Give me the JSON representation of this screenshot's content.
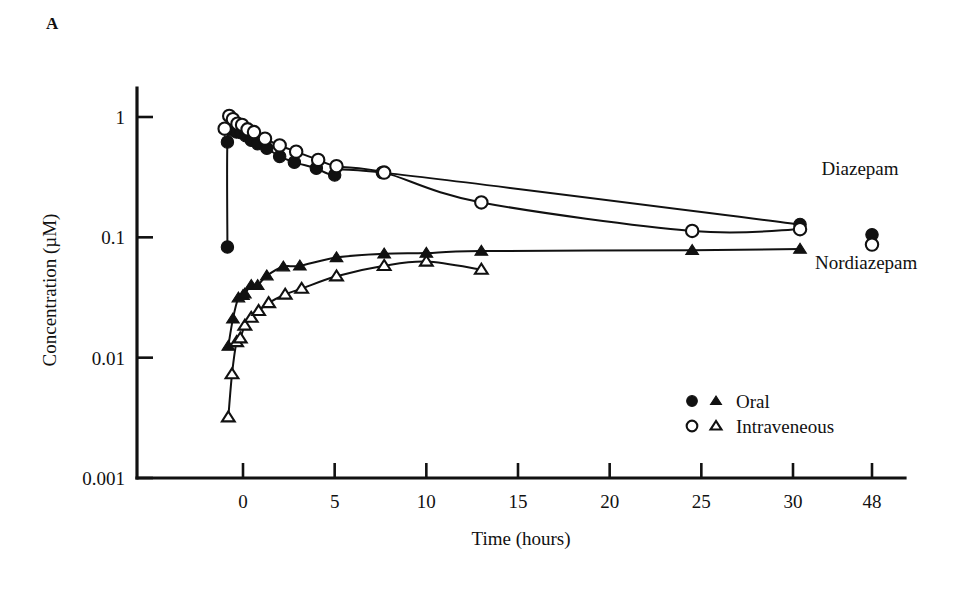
{
  "panel": {
    "label": "A"
  },
  "chart_data": {
    "type": "line",
    "title": "",
    "subtitle": "",
    "xlabel": "Time (hours)",
    "ylabel": "Concentration (µM)",
    "yscale": "log",
    "ylim": [
      0.001,
      2.0
    ],
    "yticks": [
      1,
      0.1,
      0.01,
      0.001
    ],
    "yticklabels": [
      "1",
      "0.1",
      "0.01",
      "0.001"
    ],
    "xticks": [
      0,
      5,
      10,
      15,
      20,
      25,
      30,
      48
    ],
    "xticklabels": [
      "0",
      "5",
      "10",
      "15",
      "20",
      "25",
      "30",
      "48"
    ],
    "xlim": [
      -1.8,
      50
    ],
    "x_axis_break_after": 30,
    "grid": false,
    "legend_position": "lower-right",
    "annotations": [
      {
        "text": "Diazepam",
        "x": 36.5,
        "y": 0.33
      },
      {
        "text": "Nordiazepam",
        "x": 35.0,
        "y": 0.055
      }
    ],
    "legend": [
      {
        "markers": [
          "filled-circle",
          "filled-triangle"
        ],
        "label": "Oral"
      },
      {
        "markers": [
          "open-circle",
          "open-triangle"
        ],
        "label": "Intraveneous"
      }
    ],
    "series": [
      {
        "name": "Diazepam - Oral",
        "marker": "filled-circle",
        "compound": "Diazepam",
        "route": "Oral",
        "x": [
          -0.85,
          -0.85,
          -0.6,
          -0.35,
          -0.1,
          0.15,
          0.45,
          0.8,
          1.3,
          2.0,
          2.8,
          4.0,
          5.0,
          7.6,
          31.6
        ],
        "y": [
          0.083,
          0.62,
          0.78,
          0.75,
          0.74,
          0.7,
          0.64,
          0.6,
          0.55,
          0.47,
          0.42,
          0.375,
          0.33,
          0.345,
          0.128
        ]
      },
      {
        "name": "Diazepam - Intraveneous",
        "marker": "open-circle",
        "compound": "Diazepam",
        "route": "Intraveneous",
        "x": [
          -1.0,
          -0.75,
          -0.55,
          -0.3,
          -0.05,
          0.25,
          0.6,
          1.2,
          2.0,
          2.9,
          4.1,
          5.1,
          7.7,
          13.0,
          24.5,
          31.6
        ],
        "y": [
          0.8,
          1.02,
          0.96,
          0.88,
          0.86,
          0.79,
          0.75,
          0.66,
          0.58,
          0.515,
          0.44,
          0.39,
          0.345,
          0.195,
          0.113,
          0.117
        ]
      },
      {
        "name": "Diazepam - Oral (48h)",
        "marker": "filled-circle",
        "compound": "Diazepam",
        "route": "Oral",
        "detached": true,
        "x": [
          48
        ],
        "y": [
          0.105
        ]
      },
      {
        "name": "Diazepam - Intraveneous (48h)",
        "marker": "open-circle",
        "compound": "Diazepam",
        "route": "Intraveneous",
        "detached": true,
        "x": [
          48
        ],
        "y": [
          0.087
        ]
      },
      {
        "name": "Nordiazepam - Oral",
        "marker": "filled-triangle",
        "compound": "Nordiazepam",
        "route": "Oral",
        "x": [
          -0.8,
          -0.55,
          -0.25,
          0.0,
          0.1,
          0.45,
          0.8,
          1.3,
          2.2,
          3.1,
          5.1,
          7.7,
          10.0,
          13.0,
          24.5,
          31.6
        ],
        "y": [
          0.0125,
          0.021,
          0.0315,
          0.033,
          0.034,
          0.04,
          0.04,
          0.048,
          0.057,
          0.058,
          0.068,
          0.073,
          0.074,
          0.077,
          0.078,
          0.08
        ]
      },
      {
        "name": "Nordiazepam - Intraveneous",
        "marker": "open-triangle",
        "compound": "Nordiazepam",
        "route": "Intraveneous",
        "x": [
          -0.8,
          -0.6,
          -0.35,
          -0.15,
          0.1,
          0.45,
          0.85,
          1.4,
          2.3,
          3.2,
          5.1,
          7.7,
          10.0,
          13.0
        ],
        "y": [
          0.0032,
          0.0073,
          0.0135,
          0.0145,
          0.0185,
          0.0215,
          0.0245,
          0.0285,
          0.0335,
          0.0375,
          0.0475,
          0.058,
          0.063,
          0.054
        ]
      }
    ]
  }
}
